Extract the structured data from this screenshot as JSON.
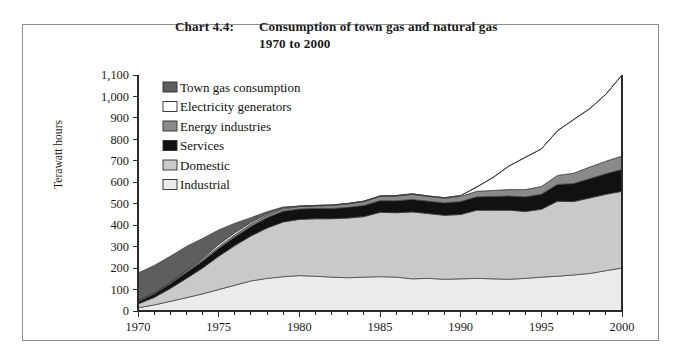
{
  "figure": {
    "chart_number": "Chart 4.4:",
    "title_line1": "Consumption of town gas and natural gas",
    "title_line2": "1970 to 2000"
  },
  "axes": {
    "ylabel": "Terawatt hours",
    "yticks": [
      "0",
      "100",
      "200",
      "300",
      "400",
      "500",
      "600",
      "700",
      "800",
      "900",
      "1,000",
      "1,100"
    ],
    "xticks": [
      "1970",
      "1975",
      "1980",
      "1985",
      "1990",
      "1995",
      "2000"
    ]
  },
  "legend": {
    "position": "upper-left-inside",
    "items": [
      {
        "label": "Town gas consumption",
        "color": "#5e5e5e"
      },
      {
        "label": "Electricity generators",
        "color": "#ffffff"
      },
      {
        "label": "Energy industries",
        "color": "#8a8a8a"
      },
      {
        "label": "Services",
        "color": "#111111"
      },
      {
        "label": "Domestic",
        "color": "#c9c9c9"
      },
      {
        "label": "Industrial",
        "color": "#ebebeb"
      }
    ]
  },
  "chart_data": {
    "type": "area",
    "title": "Consumption of town gas and natural gas 1970 to 2000",
    "xlabel": "",
    "ylabel": "Terawatt hours",
    "xlim": [
      1970,
      2000
    ],
    "ylim": [
      0,
      1100
    ],
    "grid": false,
    "stacked": true,
    "stack_order_bottom_to_top": [
      "Industrial",
      "Domestic",
      "Services",
      "Energy industries",
      "Electricity generators",
      "Town gas consumption"
    ],
    "x": [
      1970,
      1971,
      1972,
      1973,
      1974,
      1975,
      1976,
      1977,
      1978,
      1979,
      1980,
      1981,
      1982,
      1983,
      1984,
      1985,
      1986,
      1987,
      1988,
      1989,
      1990,
      1991,
      1992,
      1993,
      1994,
      1995,
      1996,
      1997,
      1998,
      1999,
      2000
    ],
    "series": [
      {
        "name": "Industrial",
        "color": "#ebebeb",
        "values": [
          15,
          28,
          45,
          62,
          80,
          100,
          120,
          140,
          152,
          160,
          165,
          162,
          158,
          155,
          158,
          160,
          158,
          150,
          152,
          148,
          150,
          152,
          150,
          148,
          152,
          158,
          162,
          168,
          175,
          188,
          200
        ]
      },
      {
        "name": "Domestic",
        "color": "#c9c9c9",
        "values": [
          18,
          35,
          60,
          90,
          120,
          155,
          185,
          210,
          235,
          255,
          262,
          268,
          272,
          278,
          282,
          300,
          300,
          312,
          302,
          298,
          300,
          318,
          320,
          322,
          312,
          316,
          350,
          342,
          352,
          356,
          358
        ]
      },
      {
        "name": "Services",
        "color": "#111111",
        "values": [
          10,
          16,
          22,
          28,
          32,
          36,
          40,
          44,
          48,
          50,
          48,
          48,
          48,
          50,
          52,
          54,
          56,
          58,
          58,
          58,
          60,
          62,
          64,
          66,
          68,
          70,
          78,
          84,
          90,
          96,
          102
        ]
      },
      {
        "name": "Energy industries",
        "color": "#8a8a8a",
        "values": [
          4,
          5,
          6,
          7,
          8,
          9,
          10,
          11,
          12,
          12,
          12,
          12,
          14,
          16,
          18,
          20,
          22,
          24,
          22,
          22,
          24,
          26,
          28,
          30,
          34,
          36,
          42,
          48,
          54,
          58,
          62
        ]
      },
      {
        "name": "Electricity generators",
        "color": "#ffffff",
        "values": [
          0,
          0,
          0,
          2,
          6,
          10,
          10,
          8,
          6,
          4,
          2,
          2,
          2,
          2,
          2,
          2,
          2,
          2,
          2,
          2,
          4,
          20,
          60,
          110,
          150,
          175,
          208,
          250,
          272,
          312,
          378
        ]
      },
      {
        "name": "Town gas consumption",
        "color": "#5e5e5e",
        "values": [
          130,
          128,
          122,
          112,
          92,
          68,
          44,
          22,
          10,
          4,
          0,
          0,
          0,
          0,
          0,
          0,
          0,
          0,
          0,
          0,
          0,
          0,
          0,
          0,
          0,
          0,
          0,
          0,
          0,
          0,
          0
        ]
      }
    ],
    "totals": [
      177,
      212,
      255,
      301,
      338,
      378,
      409,
      435,
      463,
      485,
      489,
      492,
      494,
      501,
      512,
      536,
      538,
      546,
      536,
      528,
      538,
      578,
      622,
      676,
      716,
      755,
      840,
      892,
      943,
      1010,
      1100
    ]
  }
}
